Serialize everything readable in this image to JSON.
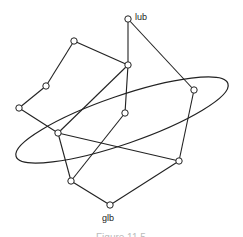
{
  "diagram": {
    "type": "lattice-hasse-diagram",
    "labels": {
      "top": "lub",
      "bottom": "glb"
    },
    "caption": "Figure 11.5",
    "nodes": [
      {
        "id": "lub",
        "x": 128,
        "y": 19,
        "label": "lub"
      },
      {
        "id": "a",
        "x": 74,
        "y": 41
      },
      {
        "id": "b",
        "x": 128,
        "y": 65
      },
      {
        "id": "c",
        "x": 46,
        "y": 86
      },
      {
        "id": "d",
        "x": 19,
        "y": 108
      },
      {
        "id": "e",
        "x": 194,
        "y": 90
      },
      {
        "id": "f",
        "x": 125,
        "y": 113
      },
      {
        "id": "g",
        "x": 58,
        "y": 133
      },
      {
        "id": "h",
        "x": 179,
        "y": 161
      },
      {
        "id": "i",
        "x": 71,
        "y": 181
      },
      {
        "id": "glb",
        "x": 110,
        "y": 205,
        "label": "glb"
      }
    ],
    "edges": [
      [
        "lub",
        "b"
      ],
      [
        "lub",
        "e"
      ],
      [
        "a",
        "b"
      ],
      [
        "a",
        "c"
      ],
      [
        "c",
        "d"
      ],
      [
        "d",
        "g"
      ],
      [
        "b",
        "f"
      ],
      [
        "b",
        "g"
      ],
      [
        "f",
        "i"
      ],
      [
        "g",
        "i"
      ],
      [
        "g",
        "h"
      ],
      [
        "e",
        "h"
      ],
      [
        "i",
        "glb"
      ],
      [
        "h",
        "glb"
      ]
    ],
    "ellipse": {
      "cx": 122,
      "cy": 120,
      "rx": 112,
      "ry": 24,
      "rotate": -19
    }
  }
}
